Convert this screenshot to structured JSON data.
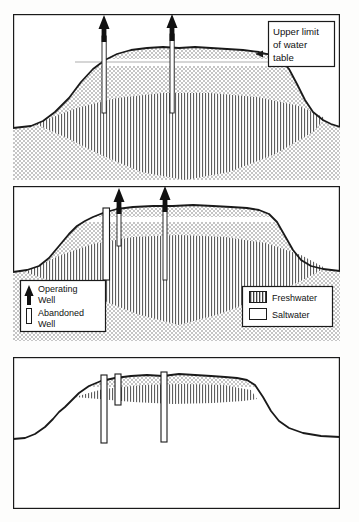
{
  "figure": {
    "type": "cross-section-diagram",
    "panel_count": 3,
    "colors": {
      "ink": "#1a1a1a",
      "freshwater_hatch": "#555555",
      "saltwater_stipple": "#707070",
      "paper": "#fdfdfc",
      "well_fill": "#ffffff"
    }
  },
  "annotations": {
    "water_table_label": {
      "line1": "Upper limit",
      "line2": "of water",
      "line3": "table",
      "full_text": "Upper limit of water table",
      "arrow": "leftward-pointer-to-water-table"
    }
  },
  "legend_wells": {
    "items": [
      {
        "symbol": "operating-well-arrow",
        "line1": "Operating",
        "line2": "Well",
        "label": "Operating Well"
      },
      {
        "symbol": "abandoned-well-casing",
        "line1": "Abandoned",
        "line2": "Well",
        "label": "Abandoned Well"
      }
    ]
  },
  "legend_water": {
    "items": [
      {
        "swatch": "vertical-hatch",
        "label": "Freshwater"
      },
      {
        "swatch": "empty-white",
        "label": "Saltwater"
      }
    ]
  },
  "panels": [
    {
      "id": "panel-top",
      "order": 1,
      "caption": "",
      "lens_state": "full thick freshwater lens, deep V",
      "wells": [
        {
          "kind": "operating",
          "x": 104,
          "depth": "shallow-into-lens"
        },
        {
          "kind": "operating",
          "x": 172,
          "depth": "shallow-into-lens"
        }
      ],
      "features": [
        "upper-limit-of-water-table-line",
        "stippled-saltwater-zone",
        "hatched-freshwater-lens"
      ]
    },
    {
      "id": "panel-middle",
      "order": 2,
      "caption": "",
      "lens_state": "reduced freshwater lens, shallower V",
      "wells": [
        {
          "kind": "abandoned",
          "x": 107,
          "depth": "deep"
        },
        {
          "kind": "operating",
          "x": 119,
          "depth": "shallow"
        },
        {
          "kind": "operating",
          "x": 165,
          "depth": "deep"
        }
      ],
      "features": [
        "stippled-saltwater-zone",
        "hatched-freshwater-lens",
        "well-legend",
        "water-legend"
      ]
    },
    {
      "id": "panel-bottom",
      "order": 3,
      "caption": "",
      "lens_state": "nearly depleted thin freshwater lens",
      "wells": [
        {
          "kind": "abandoned",
          "x": 104,
          "depth": "deep"
        },
        {
          "kind": "abandoned",
          "x": 117,
          "depth": "medium"
        },
        {
          "kind": "abandoned",
          "x": 166,
          "depth": "deep"
        }
      ],
      "features": [
        "stippled-saltwater-zone",
        "thin-hatched-freshwater-lens"
      ]
    }
  ]
}
